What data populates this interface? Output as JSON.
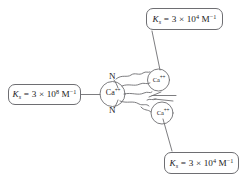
{
  "figure": {
    "background_color": "#ffffff",
    "line_color": "#6e6e72",
    "text_color": "#1b1b1d",
    "width": 242,
    "height": 182
  },
  "callouts": {
    "high_affinity": {
      "symbol": "K",
      "subscript": "s",
      "equals": "=",
      "coefficient": "3",
      "times": "×",
      "base": "10",
      "exponent": "8",
      "unit": "M",
      "unit_exponent": "−1",
      "full_text": "Ks = 3 × 108 M−1"
    },
    "top_right": {
      "symbol": "K",
      "subscript": "s",
      "equals": "=",
      "coefficient": "3",
      "times": "×",
      "base": "10",
      "exponent": "4",
      "unit": "M",
      "unit_exponent": "−1",
      "full_text": "Ks = 3 × 104 M−1"
    },
    "bottom_right": {
      "symbol": "K",
      "subscript": "s",
      "equals": "=",
      "coefficient": "3",
      "times": "×",
      "base": "10",
      "exponent": "4",
      "unit": "M",
      "unit_exponent": "−1",
      "full_text": "Ks = 3 × 104 M−1"
    }
  },
  "molecule": {
    "center_ion": {
      "element": "Ca",
      "charge": "++"
    },
    "upper_ion": {
      "element": "Ca",
      "charge": "++"
    },
    "lower_ion": {
      "element": "Ca",
      "charge": "++"
    },
    "nitrogen_top": "N",
    "nitrogen_bottom": "N"
  }
}
